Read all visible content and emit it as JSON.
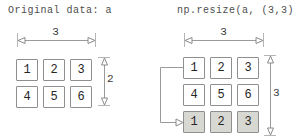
{
  "left_panel": {
    "title": "Original data: a",
    "width_label": "3",
    "height_label": "2",
    "grid": {
      "rows": [
        [
          "1",
          "2",
          "3"
        ],
        [
          "4",
          "5",
          "6"
        ]
      ]
    }
  },
  "right_panel": {
    "title": "np.resize(a, (3,3))",
    "width_label": "3",
    "height_label": "3",
    "grid": {
      "rows": [
        [
          "1",
          "2",
          "3"
        ],
        [
          "4",
          "5",
          "6"
        ],
        [
          "1",
          "2",
          "3"
        ]
      ]
    },
    "highlighted_row_index": 2
  },
  "colors": {
    "background": "#ffffff",
    "box_border": "#8f8f8f",
    "box_fill": "#ffffff",
    "box_fill_highlight": "#d8d8d3",
    "dimension_line": "#9a9a9a",
    "extension_tick": "#b5b5b5",
    "label_text": "#3a3a3a",
    "title_text": "#4d4d4d"
  }
}
